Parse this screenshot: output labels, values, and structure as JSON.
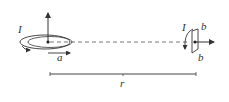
{
  "diagram": {
    "labels": {
      "big_loop_current": "I",
      "big_loop_radius": "a",
      "distance": "r",
      "small_loop_current": "I",
      "small_loop_side_top": "b",
      "small_loop_side_bottom": "b"
    },
    "colors": {
      "stroke": "#333333",
      "background": "#ffffff"
    }
  }
}
